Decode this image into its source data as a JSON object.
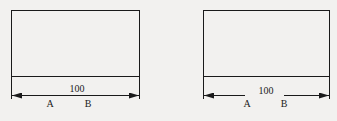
{
  "figures": [
    {
      "id": "left",
      "dimension_value": "100",
      "point_a": "A",
      "point_b": "B",
      "dimension_style": "continuous line with arrows at both ends, value above line"
    },
    {
      "id": "right",
      "dimension_value": "100",
      "point_a": "A",
      "point_b": "B",
      "dimension_style": "broken line with value in gap"
    }
  ],
  "colors": {
    "line": "#1a1a1a",
    "background": "#f2f1ef"
  }
}
